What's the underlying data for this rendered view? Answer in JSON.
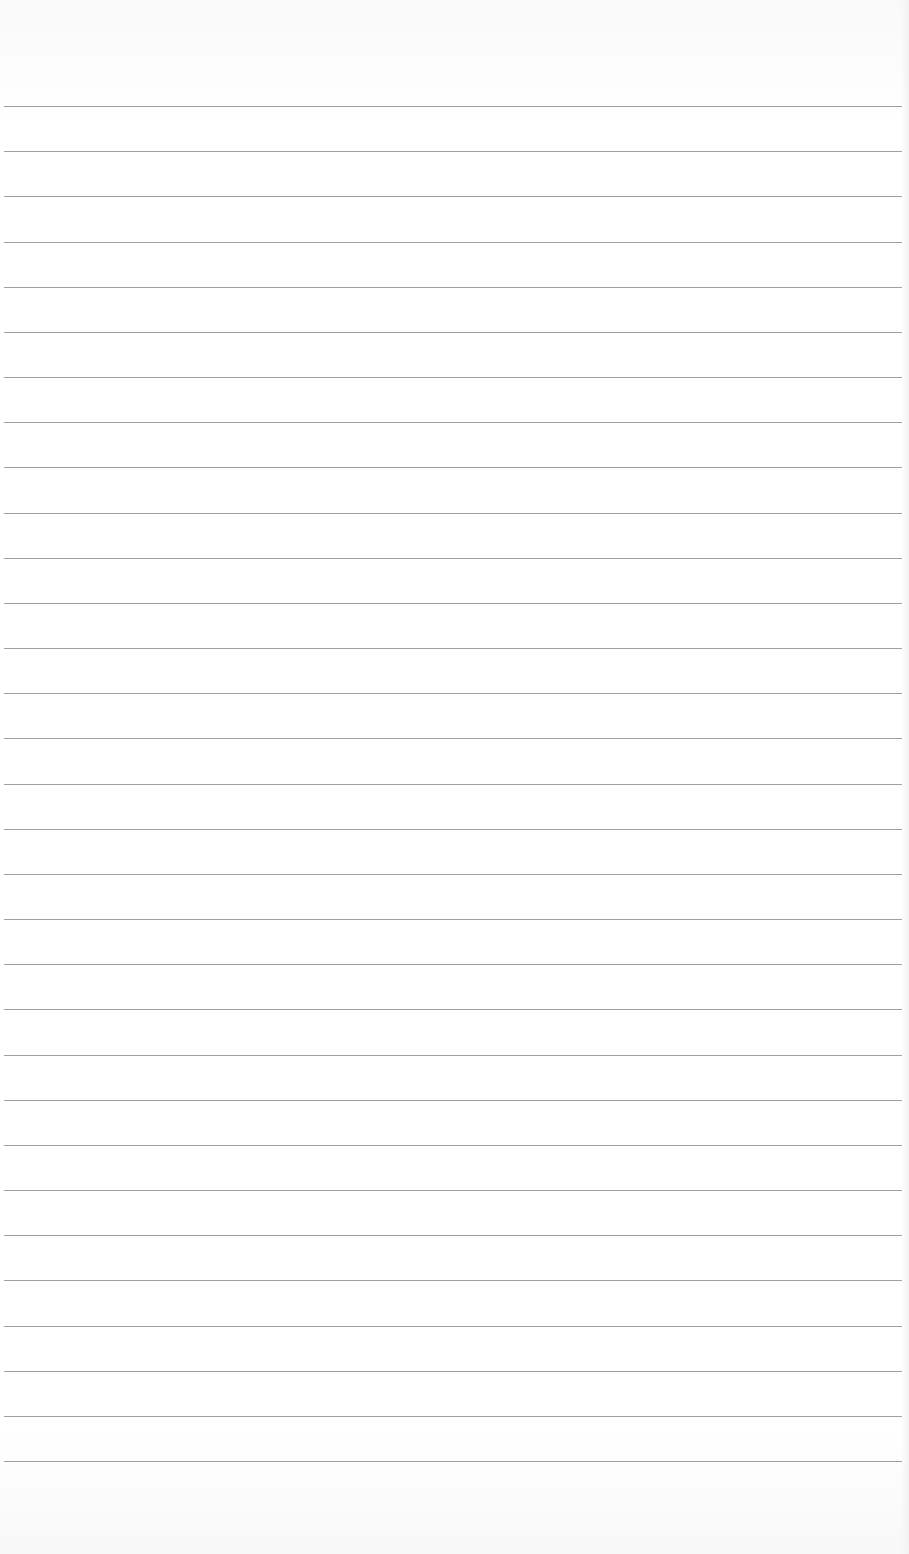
{
  "page": {
    "type": "lined-paper",
    "background_color": "#ffffff",
    "line_color": "#8e8e8e",
    "line_count": 31,
    "first_line_y": 106,
    "line_spacing": 45.17
  }
}
